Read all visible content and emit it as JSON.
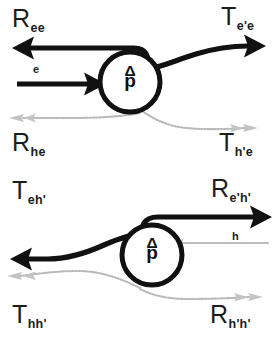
{
  "figure": {
    "background_color": "#ffffff",
    "electron_color": "#111111",
    "hole_color": "#b9b9b9"
  },
  "panels": [
    {
      "id": "top",
      "name": "electron-injection-panel",
      "incoming_particle": "e",
      "scatterer": {
        "symbol_top": "Δ",
        "symbol_bottom": "p",
        "label": "Δp"
      },
      "labels": {
        "top_left": {
          "base": "R",
          "sub": "ee"
        },
        "top_right": {
          "base": "T",
          "sub": "e'e"
        },
        "bottom_left": {
          "base": "R",
          "sub": "he"
        },
        "bottom_right": {
          "base": "T",
          "sub": "h'e"
        }
      }
    },
    {
      "id": "bottom",
      "name": "hole-injection-panel",
      "incoming_particle": "h",
      "scatterer": {
        "symbol_top": "Δ",
        "symbol_bottom": "p",
        "label": "Δp"
      },
      "labels": {
        "top_left": {
          "base": "T",
          "sub": "eh'"
        },
        "top_right": {
          "base": "R",
          "sub": "e'h'"
        },
        "bottom_left": {
          "base": "T",
          "sub": "hh'"
        },
        "bottom_right": {
          "base": "R",
          "sub": "h'h'"
        }
      }
    }
  ]
}
